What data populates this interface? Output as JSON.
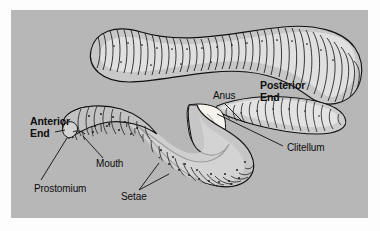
{
  "figure": {
    "panel_background_color": "#b7b7b7",
    "page_background_color": "#fdfdfd",
    "ink_color": "#0d0d0d",
    "body_fill_color": "#c9c9c9",
    "body_highlight_color": "#e6e6e6",
    "clitellum_color": "#f4f2ea"
  },
  "labels": {
    "anterior_end": "Anterior\nEnd",
    "posterior_end": "Posterior\nEnd",
    "anus": "Anus",
    "clitellum": "Clitellum",
    "mouth": "Mouth",
    "prostomium": "Prostomium",
    "setae": "Setae"
  },
  "parts": [
    {
      "name": "prostomium",
      "label": "Prostomium",
      "emphasis": "plain"
    },
    {
      "name": "mouth",
      "label": "Mouth",
      "emphasis": "plain"
    },
    {
      "name": "setae",
      "label": "Setae",
      "emphasis": "plain"
    },
    {
      "name": "clitellum",
      "label": "Clitellum",
      "emphasis": "plain"
    },
    {
      "name": "anus",
      "label": "Anus",
      "emphasis": "plain"
    },
    {
      "name": "anterior-end",
      "label": "Anterior End",
      "emphasis": "bold"
    },
    {
      "name": "posterior-end",
      "label": "Posterior End",
      "emphasis": "bold"
    }
  ]
}
